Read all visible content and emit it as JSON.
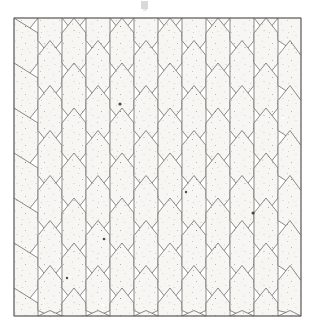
{
  "figure": {
    "title": "Hexagon-and-triangle tiling pattern",
    "caption": "",
    "kind": "geometric-tiling-illustration",
    "medium": "scanned halftone print",
    "width_px": 315,
    "height_px": 332
  },
  "canvas": {
    "background": "#ffffff",
    "pattern_left": 14,
    "pattern_top": 18,
    "pattern_right": 301,
    "pattern_bottom": 316,
    "outline_color": "#5a5a5a",
    "outline_width": 0.7
  },
  "geometry": {
    "description": "Vertically elongated hexagons arranged in columns, with pairs of triangles filling the spaces between adjacent columns.",
    "hex_half_width": 12,
    "hex_straight_height": 30,
    "hex_point_height": 15,
    "column_pitch": 24,
    "row_pitch": 45,
    "column_count": 12,
    "row_count": 7,
    "row_stagger_px": 22.5
  },
  "palette": {
    "white_speckled": "#f7f6f2",
    "light_gray": "#c9c9c4",
    "mid_gray": "#a8a8a3",
    "dark_gray": "#6e6e6b",
    "near_black": "#3b3b39",
    "black": "#2a2a28",
    "outline": "#5a5a5a",
    "paper": "#ffffff",
    "speckle": "#4a4a48"
  },
  "legend": {
    "visible": false,
    "entries": [
      {
        "label": "white speckled hexagon",
        "color": "#f7f6f2"
      },
      {
        "label": "light gray triangle",
        "color": "#c9c9c4"
      },
      {
        "label": "mid gray triangle",
        "color": "#a8a8a3"
      },
      {
        "label": "dark gray triangle",
        "color": "#6e6e6b"
      },
      {
        "label": "near black triangle",
        "color": "#3b3b39"
      }
    ]
  },
  "hex_columns": [
    {
      "index": 0,
      "x_center": 26,
      "fill": "white_speckled",
      "partial": "left-half"
    },
    {
      "index": 1,
      "x_center": 50,
      "fill": "white_speckled"
    },
    {
      "index": 2,
      "x_center": 74,
      "fill": "white_speckled"
    },
    {
      "index": 3,
      "x_center": 98,
      "fill": "white_speckled"
    },
    {
      "index": 4,
      "x_center": 122,
      "fill": "white_speckled"
    },
    {
      "index": 5,
      "x_center": 146,
      "fill": "white_speckled"
    },
    {
      "index": 6,
      "x_center": 170,
      "fill": "white_speckled"
    },
    {
      "index": 7,
      "x_center": 194,
      "fill": "white_speckled"
    },
    {
      "index": 8,
      "x_center": 218,
      "fill": "white_speckled"
    },
    {
      "index": 9,
      "x_center": 242,
      "fill": "white_speckled"
    },
    {
      "index": 10,
      "x_center": 266,
      "fill": "white_speckled"
    },
    {
      "index": 11,
      "x_center": 290,
      "fill": "white_speckled",
      "partial": "right-half"
    }
  ],
  "triangle_rows": [
    {
      "row": 0,
      "y_center": 40,
      "shades": [
        "light_gray",
        "mid_gray",
        "light_gray",
        "mid_gray",
        "light_gray",
        "dark_gray",
        "mid_gray",
        "light_gray",
        "mid_gray",
        "light_gray",
        "mid_gray",
        "light_gray"
      ]
    },
    {
      "row": 1,
      "y_center": 62,
      "shades": [
        "near_black",
        "near_black",
        "mid_gray",
        "light_gray",
        "near_black",
        "near_black",
        "dark_gray",
        "mid_gray",
        "light_gray",
        "near_black",
        "near_black",
        "mid_gray"
      ]
    },
    {
      "row": 2,
      "y_center": 85,
      "shades": [
        "light_gray",
        "mid_gray",
        "light_gray",
        "mid_gray",
        "light_gray",
        "mid_gray",
        "light_gray",
        "dark_gray",
        "mid_gray",
        "light_gray",
        "mid_gray",
        "light_gray"
      ]
    },
    {
      "row": 3,
      "y_center": 107,
      "shades": [
        "mid_gray",
        "light_gray",
        "near_black",
        "near_black",
        "mid_gray",
        "light_gray",
        "mid_gray",
        "near_black",
        "near_black",
        "light_gray",
        "mid_gray",
        "near_black"
      ]
    },
    {
      "row": 4,
      "y_center": 130,
      "shades": [
        "light_gray",
        "mid_gray",
        "light_gray",
        "dark_gray",
        "light_gray",
        "mid_gray",
        "light_gray",
        "mid_gray",
        "light_gray",
        "mid_gray",
        "light_gray",
        "mid_gray"
      ]
    },
    {
      "row": 5,
      "y_center": 152,
      "shades": [
        "near_black",
        "near_black",
        "mid_gray",
        "light_gray",
        "mid_gray",
        "dark_gray",
        "near_black",
        "light_gray",
        "mid_gray",
        "near_black",
        "mid_gray",
        "light_gray"
      ]
    },
    {
      "row": 6,
      "y_center": 175,
      "shades": [
        "mid_gray",
        "light_gray",
        "mid_gray",
        "light_gray",
        "mid_gray",
        "light_gray",
        "dark_gray",
        "mid_gray",
        "light_gray",
        "mid_gray",
        "light_gray",
        "mid_gray"
      ]
    },
    {
      "row": 7,
      "y_center": 197,
      "shades": [
        "near_black",
        "near_black",
        "near_black",
        "near_black",
        "light_gray",
        "mid_gray",
        "light_gray",
        "near_black",
        "near_black",
        "mid_gray",
        "light_gray",
        "near_black"
      ]
    },
    {
      "row": 8,
      "y_center": 220,
      "shades": [
        "light_gray",
        "mid_gray",
        "light_gray",
        "mid_gray",
        "light_gray",
        "mid_gray",
        "light_gray",
        "mid_gray",
        "light_gray",
        "dark_gray",
        "mid_gray",
        "light_gray"
      ]
    },
    {
      "row": 9,
      "y_center": 242,
      "shades": [
        "mid_gray",
        "light_gray",
        "near_black",
        "near_black",
        "mid_gray",
        "near_black",
        "near_black",
        "light_gray",
        "mid_gray",
        "light_gray",
        "near_black",
        "mid_gray"
      ]
    },
    {
      "row": 10,
      "y_center": 265,
      "shades": [
        "light_gray",
        "mid_gray",
        "light_gray",
        "mid_gray",
        "dark_gray",
        "light_gray",
        "mid_gray",
        "light_gray",
        "mid_gray",
        "light_gray",
        "mid_gray",
        "light_gray"
      ]
    },
    {
      "row": 11,
      "y_center": 287,
      "shades": [
        "near_black",
        "near_black",
        "mid_gray",
        "light_gray",
        "mid_gray",
        "near_black",
        "near_black",
        "mid_gray",
        "near_black",
        "near_black",
        "mid_gray",
        "light_gray"
      ]
    },
    {
      "row": 12,
      "y_center": 310,
      "shades": [
        "light_gray",
        "mid_gray",
        "light_gray",
        "mid_gray",
        "light_gray",
        "mid_gray",
        "dark_gray",
        "light_gray",
        "mid_gray",
        "light_gray",
        "mid_gray",
        "light_gray"
      ]
    }
  ],
  "artifacts": {
    "top_smudge_visible": true,
    "speckle_density": 0.018,
    "ink_dots": [
      {
        "x": 120,
        "y": 104,
        "r": 1.6
      },
      {
        "x": 253,
        "y": 213,
        "r": 1.5
      },
      {
        "x": 104,
        "y": 239,
        "r": 1.3
      },
      {
        "x": 67,
        "y": 278,
        "r": 1.2
      },
      {
        "x": 186,
        "y": 192,
        "r": 1.2
      }
    ],
    "white_specks": [
      {
        "x": 283,
        "y": 118,
        "r": 1.4
      },
      {
        "x": 67,
        "y": 212,
        "r": 1.5
      },
      {
        "x": 103,
        "y": 305,
        "r": 1.6
      },
      {
        "x": 70,
        "y": 277,
        "r": 1.2
      }
    ]
  }
}
